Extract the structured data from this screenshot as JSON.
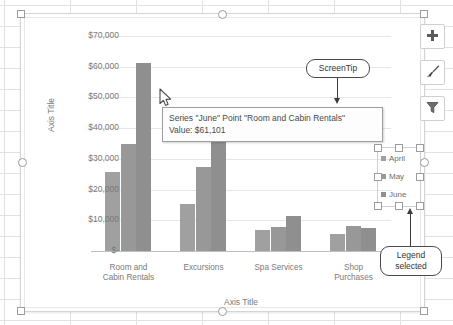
{
  "app": {
    "background": "spreadsheet-grid"
  },
  "chart_buttons": [
    {
      "name": "chart-elements-button",
      "icon": "plus-icon",
      "label": "+"
    },
    {
      "name": "chart-styles-button",
      "icon": "brush-icon",
      "label": "Brush"
    },
    {
      "name": "chart-filters-button",
      "icon": "funnel-icon",
      "label": "Filter"
    }
  ],
  "screentip": {
    "line1": "Series \"June\" Point \"Room and Cabin Rentals\"",
    "line2": "Value:  $61,101"
  },
  "callouts": [
    {
      "name": "screentip-callout",
      "text": "ScreenTip"
    },
    {
      "name": "legend-selected-callout",
      "line1": "Legend",
      "line2": "selected"
    }
  ],
  "legend": {
    "selected": true,
    "items": [
      {
        "label": "April",
        "color": "#a0a0a0"
      },
      {
        "label": "May",
        "color": "#989898"
      },
      {
        "label": "June",
        "color": "#8f8f8f"
      }
    ]
  },
  "chart_data": {
    "type": "bar",
    "title": "",
    "xlabel": "Axis Title",
    "ylabel": "Axis Title",
    "categories": [
      "Room and Cabin Rentals",
      "Excursions",
      "Spa Services",
      "Shop Purchases"
    ],
    "category_lines": [
      [
        "Room and",
        "Cabin Rentals"
      ],
      [
        "Excursions"
      ],
      [
        "Spa Services"
      ],
      [
        "Shop",
        "Purchases"
      ]
    ],
    "series": [
      {
        "name": "April",
        "color": "#a0a0a0",
        "values": [
          25800,
          15200,
          6700,
          5500
        ]
      },
      {
        "name": "May",
        "color": "#989898",
        "values": [
          35000,
          27300,
          7800,
          8200
        ]
      },
      {
        "name": "June",
        "color": "#8f8f8f",
        "values": [
          61101,
          40300,
          11500,
          7600
        ]
      }
    ],
    "ylim": [
      0,
      70000
    ],
    "ytick_values": [
      0,
      10000,
      20000,
      30000,
      40000,
      50000,
      60000,
      70000
    ],
    "ytick_labels": [
      "$-",
      "$10,000",
      "$20,000",
      "$30,000",
      "$40,000",
      "$50,000",
      "$60,000",
      "$70,000"
    ],
    "grid": true,
    "legend_position": "right",
    "highlighted_point": {
      "series": "June",
      "category": "Room and Cabin Rentals",
      "value": 61101
    }
  }
}
